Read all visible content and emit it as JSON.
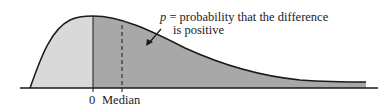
{
  "annotation": {
    "symbol": "p",
    "line1": " = probability that the difference",
    "line2": "is positive"
  },
  "axis": {
    "zero_label": "0",
    "median_label": "Median"
  },
  "colors": {
    "left_region": "#d9d9d9",
    "right_region": "#a8a8a8",
    "curve": "#1a1a1a",
    "background": "#ffffff"
  }
}
